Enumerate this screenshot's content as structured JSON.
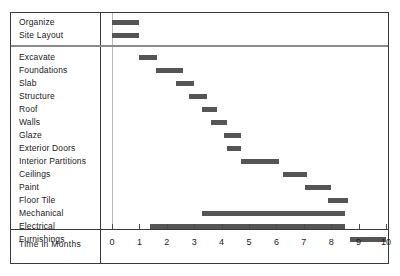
{
  "chart_data": {
    "type": "bar",
    "subtype": "gantt",
    "title": "",
    "xlabel": "Time in Months",
    "ylabel": "",
    "xlim": [
      0,
      10
    ],
    "xticks": [
      0,
      1,
      2,
      3,
      4,
      5,
      6,
      7,
      8,
      9,
      10
    ],
    "xtick_labels": [
      "0",
      "1",
      "2",
      "3",
      "4",
      "5",
      "6",
      "7",
      "8",
      "9",
      "10"
    ],
    "grid": false,
    "legend": "none",
    "bar_color": "#555555",
    "groups": [
      {
        "name": "preconstruction",
        "tasks": [
          {
            "label": "Organize",
            "start": 0.0,
            "end": 1.0
          },
          {
            "label": "Site Layout",
            "start": 0.0,
            "end": 1.0
          }
        ]
      },
      {
        "name": "construction",
        "tasks": [
          {
            "label": "Excavate",
            "start": 1.0,
            "end": 1.65
          },
          {
            "label": "Foundations",
            "start": 1.6,
            "end": 2.6
          },
          {
            "label": "Slab",
            "start": 2.35,
            "end": 3.0
          },
          {
            "label": "Structure",
            "start": 2.8,
            "end": 3.45
          },
          {
            "label": "Roof",
            "start": 3.3,
            "end": 3.85
          },
          {
            "label": "Walls",
            "start": 3.6,
            "end": 4.2
          },
          {
            "label": "Glaze",
            "start": 4.1,
            "end": 4.7
          },
          {
            "label": "Exterior Doors",
            "start": 4.2,
            "end": 4.7
          },
          {
            "label": "Interior Partitions",
            "start": 4.7,
            "end": 6.1
          },
          {
            "label": "Ceilings",
            "start": 6.25,
            "end": 7.1
          },
          {
            "label": "Paint",
            "start": 7.05,
            "end": 8.0
          },
          {
            "label": "Floor Tile",
            "start": 7.9,
            "end": 8.6
          },
          {
            "label": "Mechanical",
            "start": 3.3,
            "end": 8.5
          },
          {
            "label": "Electrical",
            "start": 1.4,
            "end": 8.5
          },
          {
            "label": "Furnishings",
            "start": 8.7,
            "end": 10.0
          }
        ]
      }
    ]
  },
  "axis": {
    "title": "Time in Months"
  }
}
